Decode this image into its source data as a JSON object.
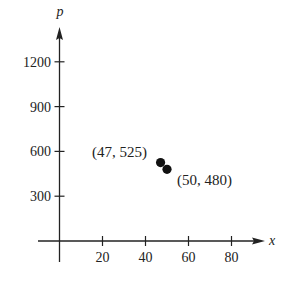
{
  "chart_data": {
    "type": "scatter",
    "title": "",
    "xlabel": "x",
    "ylabel": "p",
    "xlim": [
      0,
      90
    ],
    "ylim": [
      0,
      1400
    ],
    "x_ticks": [
      20,
      40,
      60,
      80
    ],
    "y_ticks": [
      300,
      600,
      900,
      1200
    ],
    "grid": false,
    "legend": null,
    "series": [
      {
        "name": "points",
        "points": [
          {
            "x": 47,
            "y": 525,
            "label": "(47, 525)"
          },
          {
            "x": 50,
            "y": 480,
            "label": "(50, 480)"
          }
        ]
      }
    ],
    "colors": {
      "axis": "#222222",
      "point": "#111111",
      "text": "#222222"
    }
  }
}
